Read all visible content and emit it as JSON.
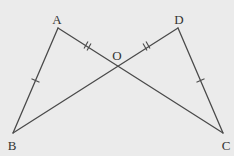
{
  "diagram": {
    "type": "geometry",
    "background": "#ebebeb",
    "stroke_color": "#4a4a4a",
    "points": {
      "A": {
        "label": "A",
        "x": 58,
        "y": 28,
        "label_x": 57,
        "label_y": 19
      },
      "D": {
        "label": "D",
        "x": 178,
        "y": 28,
        "label_x": 179,
        "label_y": 19
      },
      "O": {
        "label": "O",
        "x": 117,
        "y": 63,
        "label_x": 117,
        "label_y": 55
      },
      "B": {
        "label": "B",
        "x": 13,
        "y": 133,
        "label_x": 12,
        "label_y": 145
      },
      "C": {
        "label": "C",
        "x": 223,
        "y": 133,
        "label_x": 226,
        "label_y": 145
      }
    },
    "segments": [
      {
        "from": "A",
        "to": "B",
        "marks": 1
      },
      {
        "from": "A",
        "to": "C",
        "marks_on": "AO",
        "marks": 2
      },
      {
        "from": "D",
        "to": "B",
        "marks_on": "DO",
        "marks": 2
      },
      {
        "from": "D",
        "to": "C",
        "marks": 1
      }
    ],
    "equalities": [
      "AB = DC",
      "AO = DO"
    ]
  }
}
